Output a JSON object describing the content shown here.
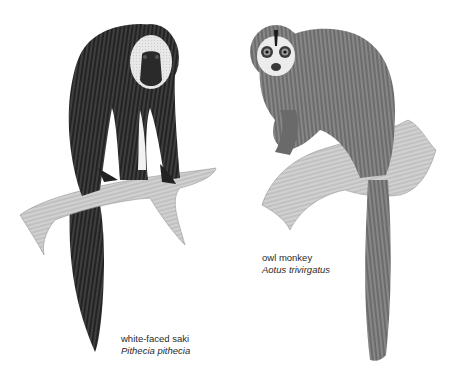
{
  "figure": {
    "illustrations": [
      {
        "id": "saki",
        "common_name": "white-faced saki",
        "scientific_name": "Pithecia pithecia"
      },
      {
        "id": "owl",
        "common_name": "owl monkey",
        "scientific_name": "Aotus trivirgatus"
      }
    ]
  },
  "colors": {
    "background": "#ffffff",
    "ink_dark": "#1e1e1e",
    "ink_mid": "#555555",
    "ink_light": "#9a9a9a",
    "caption_text": "#2a2a2a"
  }
}
